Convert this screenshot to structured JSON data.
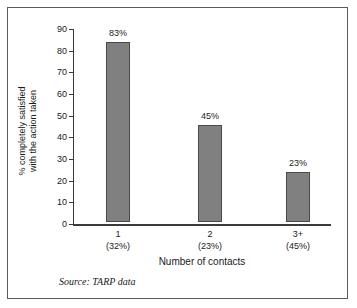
{
  "chart_data": {
    "type": "bar",
    "title": "",
    "subtitle": "",
    "xlabel": "Number of contacts",
    "ylabel": "% completely satisfied with the action taken",
    "ylabel_lines": [
      "% completely satisfied",
      "with the action taken"
    ],
    "categories": [
      "1",
      "2",
      "3+"
    ],
    "category_sublabels": [
      "(32%)",
      "(23%)",
      "(45%)"
    ],
    "values": [
      83,
      45,
      23
    ],
    "value_labels": [
      "83%",
      "45%",
      "23%"
    ],
    "ylim": [
      0,
      90
    ],
    "yticks": [
      0,
      10,
      20,
      30,
      40,
      50,
      60,
      70,
      80,
      90
    ],
    "ytick_labels": [
      "0",
      "10",
      "20",
      "30",
      "40",
      "50",
      "60",
      "70",
      "80",
      "90"
    ],
    "grid": false,
    "legend": false,
    "legend_position": "none",
    "bar_color": "#808080",
    "bar_edge_color": "#4a4a4a",
    "axis_color": "#3a3a3a",
    "background_color": "#ffffff",
    "frame_color": "#5a5a5a"
  },
  "source_note": "Source: TARP data"
}
